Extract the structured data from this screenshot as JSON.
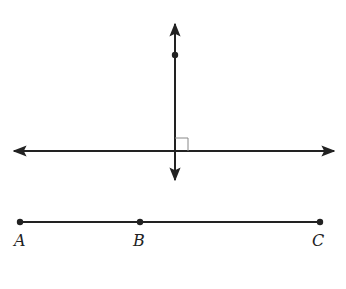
{
  "diagram": {
    "perpendicular_figure": {
      "horizontal_line": {
        "x1": 12,
        "x2": 336,
        "y": 151,
        "arrows": "both"
      },
      "vertical_line": {
        "x": 175,
        "y1": 22,
        "y2": 182,
        "arrows": "both"
      },
      "point_on_vertical": {
        "x": 175,
        "y": 55
      },
      "right_angle_marker": {
        "x": 175,
        "y": 138,
        "size": 13
      }
    },
    "segment": {
      "y": 222,
      "points": [
        {
          "label": "A",
          "x": 20
        },
        {
          "label": "B",
          "x": 140
        },
        {
          "label": "C",
          "x": 320
        }
      ]
    },
    "colors": {
      "line": "#222222",
      "marker": "#888888"
    }
  }
}
